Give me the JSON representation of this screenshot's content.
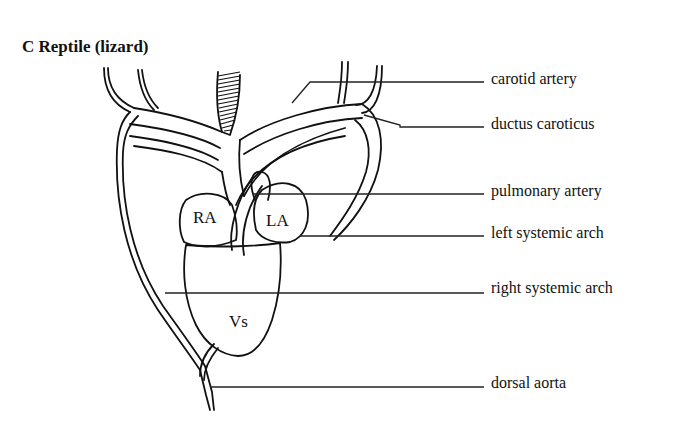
{
  "figure": {
    "title": "C Reptile (lizard)"
  },
  "chambers": {
    "right_atrium": "RA",
    "left_atrium": "LA",
    "ventricle": "Vs"
  },
  "labels": [
    {
      "id": "carotid-artery",
      "text": "carotid artery"
    },
    {
      "id": "ductus-caroticus",
      "text": "ductus caroticus"
    },
    {
      "id": "pulmonary-artery",
      "text": "pulmonary artery"
    },
    {
      "id": "left-systemic-arch",
      "text": "left systemic arch"
    },
    {
      "id": "right-systemic-arch",
      "text": "right systemic arch"
    },
    {
      "id": "dorsal-aorta",
      "text": "dorsal aorta"
    }
  ],
  "colors": {
    "ink": "#111111",
    "background": "#ffffff"
  }
}
